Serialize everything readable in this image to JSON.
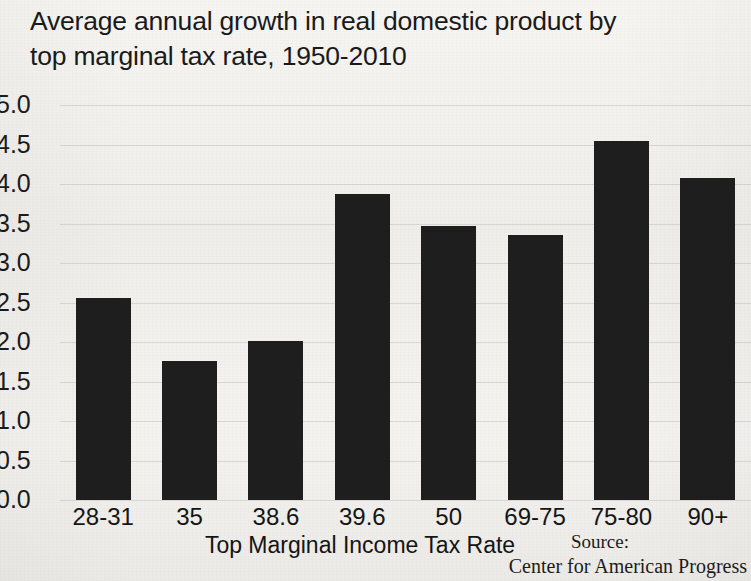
{
  "chart_data": {
    "type": "bar",
    "title": "Average annual growth in real domestic product by top marginal tax rate, 1950-2010",
    "title_line1": "Average annual growth in real domestic product by",
    "title_line2": "top marginal tax rate, 1950-2010",
    "xlabel": "Top Marginal Income Tax Rate",
    "ylabel": "",
    "categories": [
      "28-31",
      "35",
      "38.6",
      "39.6",
      "50",
      "69-75",
      "75-80",
      "90+"
    ],
    "values": [
      2.56,
      1.76,
      2.01,
      3.87,
      3.47,
      3.35,
      4.55,
      4.08
    ],
    "ylim": [
      0.0,
      5.0
    ],
    "ytick_step": 0.5,
    "ytick_labels": [
      "5.0",
      "4.5",
      "4.0",
      "3.5",
      "3.0",
      "2.5",
      "2.0",
      "1.5",
      "1.0",
      "0.5",
      "0.0"
    ],
    "grid": true,
    "legend": false,
    "bar_color": "#1e1e1e",
    "background_color": "#f2f1ee"
  },
  "source": {
    "label": "Source:",
    "organization": "Center for American Progress"
  }
}
